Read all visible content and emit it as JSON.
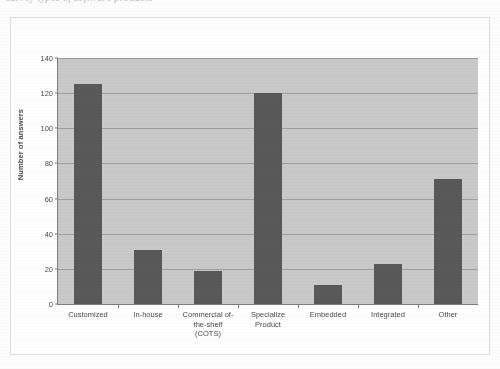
{
  "page": {
    "top_caption": "survey types of software products"
  },
  "chart_data": {
    "type": "bar",
    "title": "",
    "xlabel": "",
    "ylabel": "Number of answers",
    "categories": [
      "Customized",
      "In-house",
      "Commercial of-the-shelf (COTS)",
      "Specialize Product",
      "Embedded",
      "Integrated",
      "Other"
    ],
    "category_lines": [
      [
        "Customized"
      ],
      [
        "In-house"
      ],
      [
        "Commercial of-",
        "the-shelf",
        "(COTS)"
      ],
      [
        "Specialize",
        "Product"
      ],
      [
        "Embedded"
      ],
      [
        "Integrated"
      ],
      [
        "Other"
      ]
    ],
    "values": [
      125,
      31,
      19,
      120,
      11,
      23,
      71
    ],
    "ylim": [
      0,
      140
    ],
    "yticks": [
      0,
      20,
      40,
      60,
      80,
      100,
      120,
      140
    ],
    "ytick_labels": [
      "0",
      "20",
      "40",
      "60",
      "80",
      "100",
      "120",
      "140"
    ],
    "grid": true,
    "legend": false,
    "colors": {
      "bar": "#595959",
      "plot_background": "#c9c9c9",
      "gridline": "#9e9e9e",
      "axis": "#7d7d7d",
      "text": "#4a4a4a",
      "page_background": "#fdfdfd",
      "frame": "#dcdcdc"
    }
  }
}
